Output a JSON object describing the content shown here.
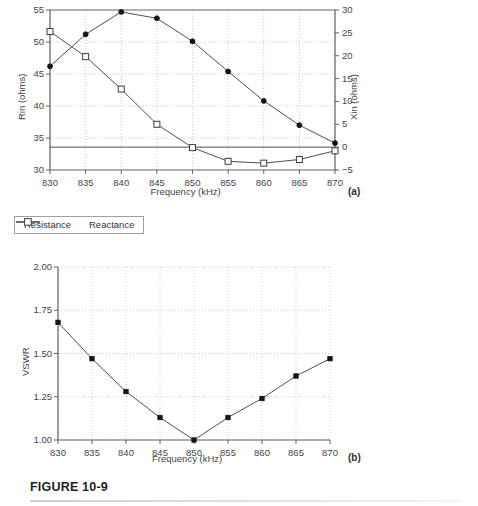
{
  "figure": {
    "caption": "FIGURE 10-9",
    "panel_a_label": "(a)",
    "panel_b_label": "(b)"
  },
  "legend": {
    "items": [
      {
        "label": "Resistance",
        "marker": "filled-circle-icon",
        "color": "#111418"
      },
      {
        "label": "Reactance",
        "marker": "open-square-icon",
        "color": "#ffffff"
      }
    ]
  },
  "chart_data": [
    {
      "type": "line",
      "id": "panel-a",
      "title": "",
      "xlabel": "Frequency (kHz)",
      "ylabel": "Rin (ohms)",
      "y2label": "Xin (ohms)",
      "x": [
        830,
        835,
        840,
        845,
        850,
        855,
        860,
        865,
        870
      ],
      "xticks": [
        "830",
        "835",
        "840",
        "845",
        "850",
        "855",
        "860",
        "865",
        "870"
      ],
      "xlim": [
        830,
        870
      ],
      "ylim": [
        30,
        55
      ],
      "yticks": [
        "30",
        "35",
        "40",
        "45",
        "50",
        "55"
      ],
      "y2lim": [
        -5,
        30
      ],
      "y2ticks": [
        "-5",
        "0",
        "5",
        "10",
        "15",
        "20",
        "25",
        "30"
      ],
      "grid": true,
      "legend_position": "below",
      "zero_reference_line": 0,
      "series": [
        {
          "name": "Resistance",
          "axis": "left",
          "unit": "ohms",
          "marker": "filled-circle",
          "values": [
            46.2,
            51.2,
            54.7,
            53.7,
            50.1,
            45.4,
            40.8,
            37.0,
            34.2
          ]
        },
        {
          "name": "Reactance",
          "axis": "right",
          "unit": "ohms",
          "marker": "open-square",
          "values": [
            25.3,
            19.8,
            12.7,
            5.0,
            -0.1,
            -3.1,
            -3.5,
            -2.7,
            -0.8
          ]
        }
      ]
    },
    {
      "type": "line",
      "id": "panel-b",
      "title": "",
      "xlabel": "Frequency (kHz)",
      "ylabel": "VSWR",
      "x": [
        830,
        835,
        840,
        845,
        850,
        855,
        860,
        865,
        870
      ],
      "xticks": [
        "830",
        "835",
        "840",
        "845",
        "850",
        "855",
        "860",
        "865",
        "870"
      ],
      "xlim": [
        830,
        870
      ],
      "ylim": [
        1.0,
        2.0
      ],
      "yticks": [
        "1.00",
        "1.25",
        "1.50",
        "1.75",
        "2.00"
      ],
      "grid": true,
      "series": [
        {
          "name": "VSWR",
          "marker": "filled-square",
          "values": [
            1.68,
            1.47,
            1.28,
            1.13,
            1.0,
            1.13,
            1.24,
            1.37,
            1.47
          ]
        }
      ]
    }
  ]
}
